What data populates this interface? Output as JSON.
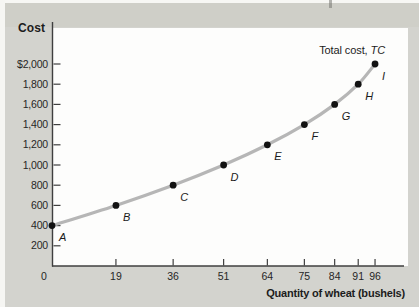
{
  "figure": {
    "y_axis_title": "Cost",
    "x_axis_title": "Quantity of wheat (bushels)",
    "curve_label": {
      "prefix": "Total cost, ",
      "symbol": "TC"
    }
  },
  "chart_data": {
    "type": "line",
    "title": "Total cost, TC",
    "xlabel": "Quantity of wheat (bushels)",
    "ylabel": "Cost",
    "x": [
      0,
      19,
      36,
      51,
      64,
      75,
      84,
      91,
      96
    ],
    "y": [
      400,
      600,
      800,
      1000,
      1200,
      1400,
      1600,
      1800,
      2000
    ],
    "point_labels": [
      "A",
      "B",
      "C",
      "D",
      "E",
      "F",
      "G",
      "H",
      "I"
    ],
    "x_tick_labels": [
      "0",
      "19",
      "36",
      "51",
      "64",
      "75",
      "84",
      "91",
      "96"
    ],
    "y_ticks": [
      200,
      400,
      600,
      800,
      1000,
      1200,
      1400,
      1600,
      1800,
      2000
    ],
    "y_tick_labels": [
      "200",
      "400",
      "600",
      "800",
      "1,000",
      "1,200",
      "1,400",
      "1,600",
      "1,800",
      "$2,000"
    ],
    "xlim": [
      0,
      105
    ],
    "ylim": [
      0,
      2400
    ],
    "grid": false,
    "legend": "none",
    "colors": {
      "curve": "#b6b6b6",
      "point": "#121212",
      "axis": "#3f3f3f",
      "tick_text": "#262626",
      "plot_background": "#fdfdfc",
      "page_background": "#d3d3ce"
    }
  }
}
